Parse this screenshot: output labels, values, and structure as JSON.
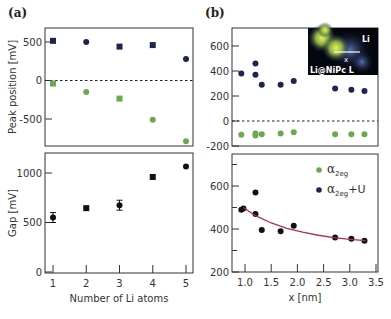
{
  "figure": {
    "panel_a_label": "(a)",
    "panel_b_label": "(b)",
    "inset": {
      "label_main": "Li@NiPc L",
      "label_li": "Li",
      "label_x": "x"
    },
    "legend": [
      {
        "name": "α2eg",
        "base": "α",
        "sub": "2eg",
        "suffix": "",
        "color": "#6aaa4e"
      },
      {
        "name": "α2eg+U",
        "base": "α",
        "sub": "2eg",
        "suffix": "+U",
        "color": "#1b2550"
      }
    ],
    "colors": {
      "navy": "#1b2550",
      "green": "#6aaa4e",
      "fit": "#b03045",
      "axis": "#333333"
    }
  },
  "chart_data": [
    {
      "id": "a-top",
      "type": "scatter",
      "title": "",
      "xlabel": "",
      "ylabel": "Peak position [mV]",
      "xlim": [
        0.9,
        5.2
      ],
      "ylim": [
        -850,
        700
      ],
      "yticks": [
        500,
        0,
        -500
      ],
      "ytick_labels": [
        "500",
        "0",
        "-500"
      ],
      "reference_line": 0,
      "x": [
        1,
        2,
        3,
        4,
        5
      ],
      "series": [
        {
          "name": "α2eg+U",
          "color": "#1b2550",
          "values": [
            515,
            500,
            440,
            460,
            280
          ],
          "markers": [
            "square",
            "circle",
            "square",
            "square",
            "circle"
          ]
        },
        {
          "name": "α2eg",
          "color": "#6aaa4e",
          "values": [
            -40,
            -150,
            -235,
            -510,
            -790
          ],
          "markers": [
            "square",
            "circle",
            "square",
            "circle",
            "circle"
          ]
        }
      ]
    },
    {
      "id": "a-bottom",
      "type": "scatter",
      "title": "",
      "xlabel": "Number of Li atoms",
      "ylabel": "Gap [mV]",
      "xlim": [
        0.9,
        5.2
      ],
      "ylim": [
        0,
        1200
      ],
      "yticks": [
        1000,
        500,
        0
      ],
      "ytick_labels": [
        "1000",
        "500",
        "0"
      ],
      "xticks": [
        1,
        2,
        3,
        4,
        5
      ],
      "xtick_labels": [
        "1",
        "2",
        "3",
        "4",
        "5"
      ],
      "x": [
        1,
        2,
        3,
        4,
        5
      ],
      "series": [
        {
          "name": "Gap",
          "color": "#111111",
          "values": [
            550,
            645,
            675,
            960,
            1065
          ],
          "errors": [
            50,
            0,
            50,
            0,
            0
          ],
          "markers": [
            "circle",
            "square",
            "circle",
            "square",
            "circle"
          ]
        }
      ]
    },
    {
      "id": "b-top",
      "type": "scatter",
      "title": "",
      "xlabel": "",
      "ylabel": "",
      "xlim": [
        0.75,
        3.5
      ],
      "ylim": [
        -200,
        750
      ],
      "yticks": [
        600,
        400,
        200,
        0,
        -200
      ],
      "ytick_labels": [
        "600",
        "400",
        "200",
        "0",
        "-200"
      ],
      "reference_line": 0,
      "x": [
        0.93,
        1.2,
        1.2,
        1.32,
        1.68,
        1.93,
        2.72,
        3.03,
        3.28
      ],
      "series": [
        {
          "name": "α2eg+U",
          "color": "#1b2550",
          "values": [
            380,
            460,
            370,
            290,
            290,
            320,
            260,
            250,
            240
          ]
        },
        {
          "name": "α2eg",
          "color": "#6aaa4e",
          "values": [
            -110,
            -100,
            -115,
            -105,
            -100,
            -90,
            -105,
            -105,
            -105
          ]
        }
      ]
    },
    {
      "id": "b-bottom",
      "type": "scatter",
      "title": "",
      "xlabel": "x [nm]",
      "ylabel": "",
      "xlim": [
        0.75,
        3.5
      ],
      "ylim": [
        200,
        750
      ],
      "yticks": [
        600,
        400,
        200
      ],
      "ytick_labels": [
        "600",
        "400",
        "200"
      ],
      "xticks": [
        1.0,
        1.5,
        2.0,
        2.5,
        3.0,
        3.5
      ],
      "xtick_labels": [
        "1.0",
        "1.5",
        "2.0",
        "2.5",
        "3.0",
        "3.5"
      ],
      "x": [
        0.93,
        0.97,
        1.2,
        1.2,
        1.32,
        1.68,
        1.93,
        2.72,
        3.03,
        3.28
      ],
      "series": [
        {
          "name": "Gap",
          "color": "#111111",
          "values": [
            490,
            495,
            570,
            470,
            395,
            390,
            415,
            360,
            355,
            345
          ]
        },
        {
          "name": "fit",
          "type": "line",
          "color": "#b03045",
          "x": [
            0.97,
            1.2,
            1.5,
            1.8,
            2.1,
            2.4,
            2.7,
            3.0,
            3.3
          ],
          "values": [
            500,
            462,
            428,
            403,
            385,
            371,
            360,
            352,
            346
          ]
        }
      ]
    }
  ]
}
